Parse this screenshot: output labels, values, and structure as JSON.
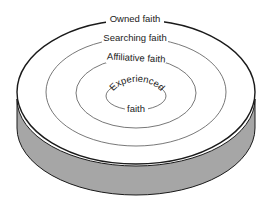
{
  "diagram": {
    "rings": [
      {
        "id": "owned",
        "label": "Owned faith"
      },
      {
        "id": "searching",
        "label": "Searching faith"
      },
      {
        "id": "affiliative",
        "label": "Affiliative faith"
      },
      {
        "id": "experienced",
        "label_top": "Experienced",
        "label_bottom": "faith"
      }
    ],
    "colors": {
      "background": "#ffffff",
      "disc_top": "#ffffff",
      "disc_side": "#a6a6a6",
      "outline": "#1a1a1a",
      "ring_line": "#555555",
      "text": "#222222"
    }
  }
}
